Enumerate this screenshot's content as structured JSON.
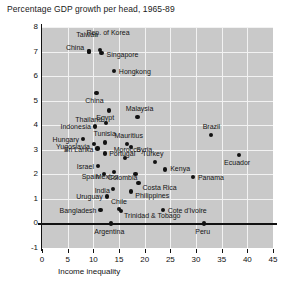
{
  "chart_data": {
    "type": "scatter",
    "title": "Percentage GDP growth per head, 1965-89",
    "xlabel": "Income inequality",
    "ylabel": "",
    "xlim": [
      0,
      45
    ],
    "ylim": [
      -1,
      8
    ],
    "xticks": [
      "0",
      "5",
      "10",
      "15",
      "20",
      "25",
      "30",
      "35",
      "40",
      "45"
    ],
    "yticks": [
      "8",
      "7",
      "6",
      "5",
      "4",
      "3",
      "2",
      "1",
      "0",
      "-1"
    ],
    "grid": true,
    "legend": "none",
    "points": [
      {
        "label": "Taiwan",
        "x": 9.2,
        "y": 7.0,
        "pos": "t",
        "dx": -2,
        "dy": -14
      },
      {
        "label": "Rep. of Korea",
        "x": 11.3,
        "y": 7.05,
        "pos": "t",
        "dx": 8,
        "dy": -14
      },
      {
        "label": "China",
        "x": 9.2,
        "y": 7.0,
        "pos": "l",
        "dx": -5,
        "dy": -5
      },
      {
        "label": "Singapore",
        "x": 11.6,
        "y": 6.95,
        "pos": "r",
        "dx": 5,
        "dy": 1
      },
      {
        "label": "Hongkong",
        "x": 14.0,
        "y": 6.2,
        "pos": "r",
        "dx": 5,
        "dy": 0
      },
      {
        "label": "China",
        "x": 10.6,
        "y": 5.3,
        "pos": "b",
        "dx": -2,
        "dy": 4
      },
      {
        "label": "Egypt",
        "x": 13.1,
        "y": 4.6,
        "pos": "b",
        "dx": -4,
        "dy": 4
      },
      {
        "label": "Malaysia",
        "x": 18.6,
        "y": 4.35,
        "pos": "t",
        "dx": 2,
        "dy": -5
      },
      {
        "label": "Thailand",
        "x": 12.5,
        "y": 4.1,
        "pos": "l",
        "dx": -4,
        "dy": -4
      },
      {
        "label": "Indonesia",
        "x": 10.3,
        "y": 3.95,
        "pos": "l",
        "dx": -4,
        "dy": 0
      },
      {
        "label": "Hungary",
        "x": 8.0,
        "y": 3.45,
        "pos": "l",
        "dx": -4,
        "dy": 0
      },
      {
        "label": "Yugoslavia",
        "x": 10.1,
        "y": 3.25,
        "pos": "l",
        "dx": -4,
        "dy": 2
      },
      {
        "label": "Tunisia",
        "x": 12.2,
        "y": 3.3,
        "pos": "t",
        "dx": 0,
        "dy": -5
      },
      {
        "label": "Mauritius",
        "x": 16.5,
        "y": 3.25,
        "pos": "t",
        "dx": 2,
        "dy": -5
      },
      {
        "label": "Syria",
        "x": 17.4,
        "y": 3.1,
        "pos": "r",
        "dx": 5,
        "dy": 2
      },
      {
        "label": "Sri Lanka",
        "x": 10.8,
        "y": 3.05,
        "pos": "l",
        "dx": -4,
        "dy": 0
      },
      {
        "label": "Portugal",
        "x": 12.3,
        "y": 2.85,
        "pos": "r",
        "dx": 4,
        "dy": 0
      },
      {
        "label": "Morocco",
        "x": 16.2,
        "y": 2.65,
        "pos": "t",
        "dx": 2,
        "dy": -5
      },
      {
        "label": "Israel",
        "x": 10.9,
        "y": 2.35,
        "pos": "l",
        "dx": -4,
        "dy": 0
      },
      {
        "label": "Turkey",
        "x": 22.0,
        "y": 2.5,
        "pos": "t",
        "dx": -2,
        "dy": -5
      },
      {
        "label": "Kenya",
        "x": 24.0,
        "y": 2.2,
        "pos": "r",
        "dx": 5,
        "dy": -1
      },
      {
        "label": "Mexico",
        "x": 14.0,
        "y": 2.1,
        "pos": "l",
        "dx": 4,
        "dy": 4
      },
      {
        "label": "Spain",
        "x": 12.0,
        "y": 2.0,
        "pos": "l",
        "dx": -4,
        "dy": 2
      },
      {
        "label": "Colombia",
        "x": 18.2,
        "y": 2.0,
        "pos": "l",
        "dx": 2,
        "dy": 3
      },
      {
        "label": "Brazil",
        "x": 33.0,
        "y": 3.6,
        "pos": "t",
        "dx": 0,
        "dy": -5
      },
      {
        "label": "Ecuador",
        "x": 38.4,
        "y": 2.8,
        "pos": "b",
        "dx": -2,
        "dy": 4
      },
      {
        "label": "Panama",
        "x": 29.4,
        "y": 1.9,
        "pos": "r",
        "dx": 5,
        "dy": 0
      },
      {
        "label": "Costa Rica",
        "x": 18.8,
        "y": 1.65,
        "pos": "r",
        "dx": 4,
        "dy": 4
      },
      {
        "label": "India",
        "x": 13.8,
        "y": 1.4,
        "pos": "l",
        "dx": -3,
        "dy": 1
      },
      {
        "label": "Philippines",
        "x": 17.4,
        "y": 1.3,
        "pos": "r",
        "dx": 4,
        "dy": 3
      },
      {
        "label": "Uruguay",
        "x": 12.6,
        "y": 1.1,
        "pos": "l",
        "dx": -4,
        "dy": 0
      },
      {
        "label": "Chile",
        "x": 15.0,
        "y": 0.6,
        "pos": "t",
        "dx": 0,
        "dy": -4
      },
      {
        "label": "Bangladesh",
        "x": 11.4,
        "y": 0.55,
        "pos": "l",
        "dx": -4,
        "dy": 0
      },
      {
        "label": "Trinidad & Tobago",
        "x": 15.4,
        "y": 0.5,
        "pos": "r",
        "dx": 3,
        "dy": 4
      },
      {
        "label": "Cote d'Ivoire",
        "x": 23.5,
        "y": 0.55,
        "pos": "r",
        "dx": 5,
        "dy": 0
      },
      {
        "label": "Argentina",
        "x": 13.5,
        "y": 0.0,
        "pos": "b",
        "dx": -2,
        "dy": 5
      },
      {
        "label": "Peru",
        "x": 31.5,
        "y": 0.0,
        "pos": "b",
        "dx": -1,
        "dy": 5
      }
    ]
  }
}
